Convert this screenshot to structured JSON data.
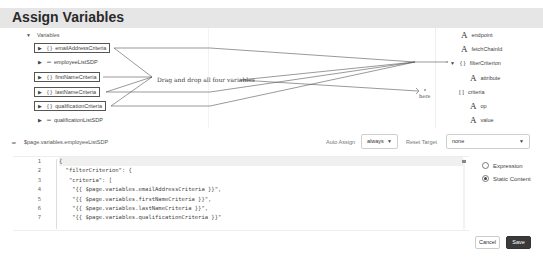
{
  "dialog": {
    "title": "Assign Variables"
  },
  "sources": {
    "root_label": "Variables",
    "items": [
      {
        "label": "emailAddressCriteria",
        "icon": "object-icon",
        "glyph": "{ }",
        "highlighted": true
      },
      {
        "label": "employeeListSDP",
        "icon": "sdp-icon",
        "glyph": "═",
        "highlighted": false
      },
      {
        "label": "firstNameCriteria",
        "icon": "object-icon",
        "glyph": "{ }",
        "highlighted": true
      },
      {
        "label": "lastNameCriteria",
        "icon": "object-icon",
        "glyph": "{ }",
        "highlighted": true
      },
      {
        "label": "qualificationCriteria",
        "icon": "object-icon",
        "glyph": "{ }",
        "highlighted": true
      },
      {
        "label": "qualificationListSDP",
        "icon": "sdp-icon",
        "glyph": "═",
        "highlighted": false
      }
    ]
  },
  "targets": {
    "items": [
      {
        "label": "endpoint",
        "type": "string",
        "glyph": "A"
      },
      {
        "label": "fetchChainId",
        "type": "string",
        "glyph": "A"
      },
      {
        "label": "filterCriterion",
        "type": "object",
        "glyph": "{ }"
      },
      {
        "label": "attribute",
        "type": "string",
        "glyph": "A"
      },
      {
        "label": "criteria",
        "type": "array",
        "glyph": "[ ]"
      },
      {
        "label": "op",
        "type": "string",
        "glyph": "A"
      },
      {
        "label": "value",
        "type": "string",
        "glyph": "A"
      }
    ]
  },
  "annotations": {
    "instruction": "Drag and drop all four variables",
    "here": "here"
  },
  "assignment": {
    "variable_path": "$page.variables.employeeListSDP",
    "auto_assign_label": "Auto Assign",
    "auto_assign_value": "always",
    "reset_target_label": "Reset Target",
    "reset_target_value": "none"
  },
  "editor": {
    "line_numbers": [
      "1",
      "2",
      "3",
      "4",
      "5",
      "6",
      "7"
    ],
    "lines": [
      "{",
      "  \"filterCriterion\": {",
      "   \"criteria\": [",
      "    \"{{ $page.variables.emailAddressCriteria }}\",",
      "    \"{{ $page.variables.firstNameCriteria }}\",",
      "    \"{{ $page.variables.lastNameCriteria }}\",",
      "    \"{{ $page.variables.qualificationCriteria }}\""
    ]
  },
  "mode": {
    "options": [
      {
        "label": "Expression",
        "selected": false
      },
      {
        "label": "Static Content",
        "selected": true
      }
    ]
  },
  "footer": {
    "cancel_label": "Cancel",
    "save_label": "Save"
  }
}
